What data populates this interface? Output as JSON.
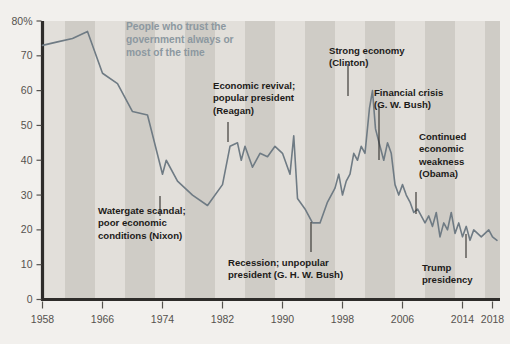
{
  "chart_data": {
    "type": "line",
    "xlabel": "",
    "ylabel": "",
    "xlim": [
      1958,
      2019
    ],
    "ylim": [
      0,
      80
    ],
    "grid": false,
    "legend": "none",
    "y_ticks": [
      "0",
      "10",
      "20",
      "30",
      "40",
      "50",
      "60",
      "70",
      "80%"
    ],
    "y_tick_values": [
      0,
      10,
      20,
      30,
      40,
      50,
      60,
      70,
      80
    ],
    "x_ticks": [
      "1958",
      "1966",
      "1974",
      "1982",
      "1990",
      "1998",
      "2006",
      "2014",
      "2018"
    ],
    "x_tick_values": [
      1958,
      1966,
      1974,
      1982,
      1990,
      1998,
      2006,
      2014,
      2018
    ],
    "series": [
      {
        "name": "Trust in government",
        "color": "#6f7b84",
        "x": [
          1958,
          1960,
          1962,
          1964,
          1966,
          1968,
          1970,
          1972,
          1974,
          1974.5,
          1976,
          1978,
          1980,
          1982,
          1983,
          1984,
          1984.5,
          1985,
          1986,
          1987,
          1988,
          1989,
          1990,
          1991,
          1991.5,
          1992,
          1993,
          1994,
          1995,
          1996,
          1997,
          1997.5,
          1998,
          1998.5,
          1999,
          1999.5,
          2000,
          2000.5,
          2001,
          2001.6,
          2002,
          2002.4,
          2003,
          2003.5,
          2004,
          2004.5,
          2005,
          2005.5,
          2006,
          2006.5,
          2007,
          2007.5,
          2008,
          2008.5,
          2009,
          2009.5,
          2010,
          2010.5,
          2011,
          2011.5,
          2012,
          2012.5,
          2013,
          2013.5,
          2014,
          2014.5,
          2015,
          2015.5,
          2016,
          2016.5,
          2017,
          2017.5,
          2018,
          2018.6
        ],
        "y": [
          73,
          74,
          75,
          77,
          65,
          62,
          54,
          53,
          36,
          40,
          34,
          30,
          27,
          33,
          44,
          45,
          40,
          44,
          38,
          42,
          41,
          44,
          42,
          36,
          47,
          29,
          26,
          22,
          22,
          28,
          32,
          36,
          30,
          34,
          36,
          42,
          40,
          44,
          42,
          55,
          60,
          49,
          44,
          40,
          45,
          42,
          33,
          30,
          33,
          30,
          28,
          25,
          26,
          24,
          22,
          24,
          21,
          25,
          18,
          22,
          20,
          25,
          19,
          22,
          18,
          21,
          17,
          20,
          19,
          18,
          19,
          20,
          18,
          17
        ]
      }
    ],
    "background_bands": {
      "description": "alternating shaded bands marking presidential terms",
      "color_light": "#e2dfda",
      "color_dark": "#cfccc6",
      "boundaries": [
        1958,
        1961,
        1965,
        1969,
        1973,
        1977,
        1981,
        1985,
        1989,
        1993,
        1997,
        2001,
        2005,
        2009,
        2013,
        2017,
        2019
      ]
    },
    "annotations": [
      {
        "id": "nixon",
        "lines": [
          "Watergate scandal;",
          "poor economic",
          "conditions (Nixon)"
        ],
        "label_x": 98,
        "label_y": 214,
        "leader": {
          "x": 160,
          "y1": 196,
          "y2": 216
        }
      },
      {
        "id": "reagan",
        "lines": [
          "Economic revival;",
          "popular president",
          "(Reagan)"
        ],
        "label_x": 213,
        "label_y": 89,
        "leader": {
          "x": 228,
          "y1": 122,
          "y2": 142
        }
      },
      {
        "id": "ghw-bush",
        "lines": [
          "Recession; unpopular",
          "president (G. H. W. Bush)"
        ],
        "label_x": 228,
        "label_y": 266,
        "leader": {
          "x": 311,
          "y1": 222,
          "y2": 252
        }
      },
      {
        "id": "clinton",
        "lines": [
          "Strong economy",
          "(Clinton)"
        ],
        "label_x": 329,
        "label_y": 54,
        "leader": {
          "x": 348,
          "y1": 64,
          "y2": 96
        }
      },
      {
        "id": "gw-bush",
        "lines": [
          "Financial crisis",
          "(G. W. Bush)"
        ],
        "label_x": 374,
        "label_y": 96,
        "leader": {
          "x": 379,
          "y1": 106,
          "y2": 160
        }
      },
      {
        "id": "obama",
        "lines": [
          "Continued",
          "economic",
          "weakness",
          "(Obama)"
        ],
        "label_x": 419,
        "label_y": 140,
        "leader": {
          "x": 416,
          "y1": 192,
          "y2": 214
        }
      },
      {
        "id": "trump",
        "lines": [
          "Trump",
          "presidency"
        ],
        "label_x": 422,
        "label_y": 271,
        "leader": {
          "x": 466,
          "y1": 234,
          "y2": 258
        }
      }
    ],
    "title_position": {
      "x": 126,
      "y": 30
    }
  }
}
